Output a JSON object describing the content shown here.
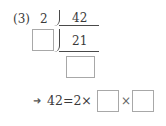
{
  "problem": {
    "number_label": "(3)",
    "divisor_1": "2",
    "dividend_1": "42",
    "dividend_2": "21",
    "arrow": "➜",
    "equation_prefix": "42=2×",
    "times": "×"
  },
  "blanks": [
    "divisor-2",
    "quotient",
    "factor-1",
    "factor-2"
  ]
}
